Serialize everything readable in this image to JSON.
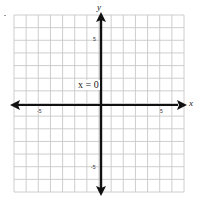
{
  "chart_data": {
    "type": "line",
    "title": "",
    "xlabel": "x",
    "ylabel": "y",
    "xlim": [
      -7,
      7
    ],
    "ylim": [
      -7,
      7
    ],
    "grid": true,
    "grid_step": 1,
    "x_tick_labels": [
      "-5",
      "5"
    ],
    "y_tick_labels": [
      "5",
      "-5"
    ],
    "series": [
      {
        "name": "x = 0",
        "description": "vertical line along the y-axis",
        "points": [
          [
            0,
            -7
          ],
          [
            0,
            7
          ]
        ]
      }
    ],
    "annotations": [
      {
        "text": "x = 0",
        "x": -1.1,
        "y": 1.5
      }
    ],
    "legend": "none"
  },
  "labels": {
    "x_axis": "x",
    "y_axis": "y",
    "annotation": "x = 0",
    "x_tick_neg5": "-5",
    "x_tick_5": "5",
    "y_tick_5": "5",
    "y_tick_neg5": "-5"
  },
  "colors": {
    "grid": "#c8c8c8",
    "axis": "#111111",
    "background": "#ffffff"
  }
}
